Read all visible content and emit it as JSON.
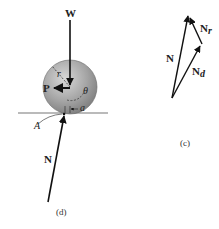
{
  "figure_d": {
    "labels": {
      "weight": "W",
      "push_force": "P",
      "radius": "r",
      "angle": "θ",
      "offset": "a",
      "contact_point": "A",
      "normal": "N"
    },
    "caption": "(d)"
  },
  "figure_c": {
    "labels": {
      "normal": "N",
      "normal_r": "N",
      "normal_r_sub": "r",
      "normal_d": "N",
      "normal_d_sub": "d"
    },
    "caption": "(c)"
  },
  "colors": {
    "wheel_fill": "#9a9a9a",
    "ground": "#777777",
    "arrow": "#111111"
  }
}
